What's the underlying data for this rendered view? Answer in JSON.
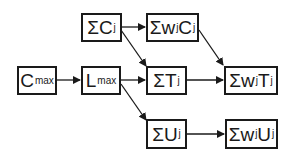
{
  "diagram": {
    "nodes": [
      {
        "id": "cmax",
        "main": "C",
        "sub": "max",
        "x": 17,
        "y": 66,
        "w": 40,
        "h": 29
      },
      {
        "id": "lmax",
        "main": "L",
        "sub": "max",
        "x": 81,
        "y": 66,
        "w": 40,
        "h": 29
      },
      {
        "id": "sumc",
        "main": "ΣC",
        "sub": "j",
        "x": 81,
        "y": 13,
        "w": 41,
        "h": 29
      },
      {
        "id": "sumwc",
        "main": "Σw",
        "mid": "C",
        "sub": "j",
        "x": 146,
        "y": 13,
        "w": 53,
        "h": 29
      },
      {
        "id": "sumt",
        "main": "ΣT",
        "sub": "j",
        "x": 146,
        "y": 66,
        "w": 41,
        "h": 29
      },
      {
        "id": "sumwt",
        "main": "Σw",
        "mid": "T",
        "sub": "j",
        "x": 224,
        "y": 66,
        "w": 54,
        "h": 29
      },
      {
        "id": "sumu",
        "main": "ΣU",
        "sub": "j",
        "x": 146,
        "y": 119,
        "w": 41,
        "h": 30
      },
      {
        "id": "sumwu",
        "main": "Σw",
        "mid": "U",
        "sub": "j",
        "x": 225,
        "y": 119,
        "w": 53,
        "h": 30
      }
    ],
    "edges": [
      {
        "from": "cmax",
        "to": "lmax"
      },
      {
        "from": "lmax",
        "to": "sumt"
      },
      {
        "from": "lmax",
        "to": "sumu"
      },
      {
        "from": "sumc",
        "to": "sumwc"
      },
      {
        "from": "sumc",
        "to": "sumt"
      },
      {
        "from": "sumwc",
        "to": "sumwt"
      },
      {
        "from": "sumt",
        "to": "sumwt"
      },
      {
        "from": "sumu",
        "to": "sumwu"
      }
    ],
    "labels": {
      "cmax": {
        "a": "C",
        "s": "max"
      },
      "lmax": {
        "a": "L",
        "s": "max"
      },
      "sumc": {
        "a": "ΣC",
        "s": "j"
      },
      "sumwc": {
        "a": "Σw",
        "s": "j",
        "b": "C",
        "t": "j"
      },
      "sumt": {
        "a": "ΣT",
        "s": "j"
      },
      "sumwt": {
        "a": "Σw",
        "s": "j",
        "b": "T",
        "t": "j"
      },
      "sumu": {
        "a": "ΣU",
        "s": "j"
      },
      "sumwu": {
        "a": "Σw",
        "s": "j",
        "b": "U",
        "t": "j"
      }
    }
  }
}
